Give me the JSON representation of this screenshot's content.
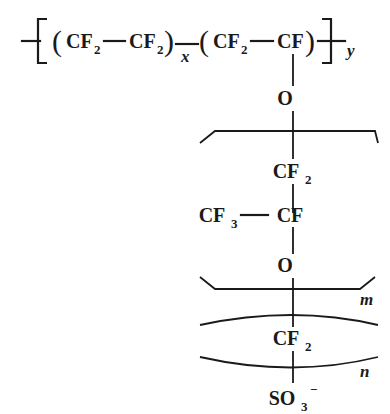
{
  "diagram": {
    "kind": "chemical-structure",
    "background_color": "#ffffff",
    "ink_color": "#1a1a1a",
    "backbone": {
      "open_bracket": "[",
      "close_bracket": "]",
      "open_paren_1": "(",
      "close_paren_1": ")",
      "open_paren_2": "(",
      "close_paren_2": ")",
      "unit_1_left": "CF",
      "unit_1_left_sub": "2",
      "unit_1_right": "CF",
      "unit_1_right_sub": "2",
      "unit_1_index": "x",
      "unit_2_left": "CF",
      "unit_2_left_sub": "2",
      "unit_2_right": "CF",
      "unit_2_index": "y"
    },
    "sidechain": [
      {
        "label": "O",
        "sub": "",
        "sup": ""
      },
      {
        "label": "CF",
        "sub": "2",
        "sup": ""
      },
      {
        "label": "CF",
        "sub": "",
        "sup": ""
      },
      {
        "label": "O",
        "sub": "",
        "sup": ""
      },
      {
        "label": "CF",
        "sub": "2",
        "sup": ""
      },
      {
        "label": "SO",
        "sub": "3",
        "sup": "−"
      }
    ],
    "branch": {
      "label": "CF",
      "sub": "3"
    },
    "group_m_index": "m",
    "group_n_index": "n"
  }
}
